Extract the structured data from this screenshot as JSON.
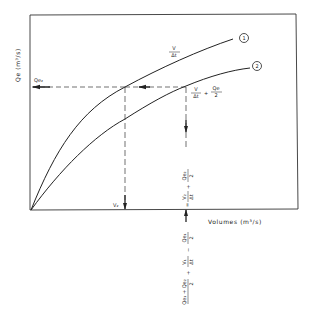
{
  "diagram": {
    "y_axis_label": "Qe (m³/s)",
    "x_axis_label": "Volumes (m³/s)",
    "curves": [
      {
        "id": "1",
        "marker": "1",
        "label_num": "V",
        "label_den": "Δt"
      },
      {
        "id": "2",
        "marker": "2",
        "label_num": "V",
        "label_den": "Δt",
        "label_plus": "+",
        "label_extra_num": "Qe",
        "label_extra_den": "2"
      }
    ],
    "horizontal_marker": "Qe₂",
    "vertical_marker": "V₂",
    "vertical_annotation_upper": {
      "term1_num": "V₂",
      "term1_den": "Δt",
      "plus": "+",
      "term2_num": "Qe₂",
      "term2_den": "2",
      "equals": "="
    },
    "vertical_annotation_lower": {
      "term1_num": "Qe₁",
      "term1_den": "2",
      "minus": "−",
      "term2_num": "V₁",
      "term2_den": "Δt",
      "plus": "+",
      "term3_num": "Qe₁ + Qe₂",
      "term3_den": "2"
    }
  },
  "colors": {
    "line": "#222222",
    "background": "#ffffff"
  }
}
